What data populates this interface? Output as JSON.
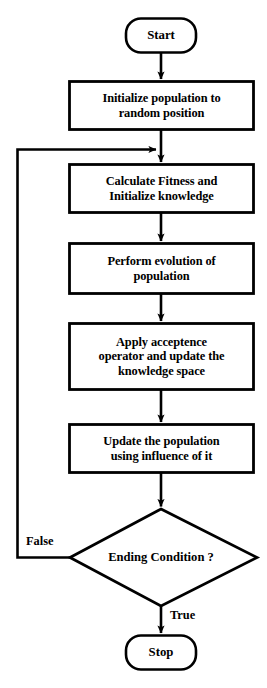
{
  "diagram": {
    "stroke_color": "#000000",
    "fill_color": "#ffffff",
    "nodes": [
      {
        "id": "start",
        "type": "terminator",
        "label": "Start"
      },
      {
        "id": "init",
        "type": "process",
        "label": "Initialize population to\nrandom position"
      },
      {
        "id": "fitness",
        "type": "process",
        "label": "Calculate Fitness and\nInitialize knowledge"
      },
      {
        "id": "evolve",
        "type": "process",
        "label": "Perform evolution of\npopulation"
      },
      {
        "id": "accept",
        "type": "process",
        "label": "Apply acceptence\noperator and update the\nknowledge space"
      },
      {
        "id": "update",
        "type": "process",
        "label": "Update the population\nusing influence of it"
      },
      {
        "id": "ending",
        "type": "decision",
        "label": "Ending Condition ?"
      },
      {
        "id": "stop",
        "type": "terminator",
        "label": "Stop"
      }
    ],
    "edges": [
      {
        "id": "e-start-init",
        "from": "start",
        "to": "init",
        "label": ""
      },
      {
        "id": "e-init-fitness",
        "from": "init",
        "to": "fitness",
        "label": ""
      },
      {
        "id": "e-fitness-evolve",
        "from": "fitness",
        "to": "evolve",
        "label": ""
      },
      {
        "id": "e-evolve-accept",
        "from": "evolve",
        "to": "accept",
        "label": ""
      },
      {
        "id": "e-accept-update",
        "from": "accept",
        "to": "update",
        "label": ""
      },
      {
        "id": "e-update-ending",
        "from": "update",
        "to": "ending",
        "label": ""
      },
      {
        "id": "e-ending-false",
        "from": "ending",
        "to": "fitness",
        "label": "False"
      },
      {
        "id": "e-ending-true",
        "from": "ending",
        "to": "stop",
        "label": "True"
      }
    ],
    "edge_labels": {
      "false": "False",
      "true": "True"
    }
  }
}
